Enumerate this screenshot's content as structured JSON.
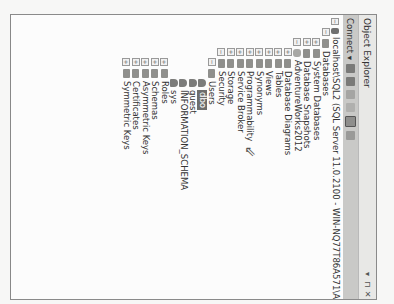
{
  "panel": {
    "title": "Object Explorer",
    "controls": {
      "pin": "▾",
      "autohide": "⊓",
      "close": "✕"
    }
  },
  "toolbar": {
    "connect_label": "Connect ▾"
  },
  "tree": [
    {
      "level": 0,
      "expander": "−",
      "icon": "server",
      "label": "localhost\\SQL2 (SQL Server 11.0.2100 - WIN-NQ77T86A571\\A"
    },
    {
      "level": 1,
      "expander": "−",
      "icon": "folder",
      "label": "Databases"
    },
    {
      "level": 2,
      "expander": "+",
      "icon": "folder",
      "label": "System Databases"
    },
    {
      "level": 2,
      "expander": "+",
      "icon": "folder",
      "label": "Database Snapshots"
    },
    {
      "level": 2,
      "expander": "−",
      "icon": "db",
      "label": "AdventureWorks2012"
    },
    {
      "level": 3,
      "expander": "+",
      "icon": "folder",
      "label": "Database Diagrams"
    },
    {
      "level": 3,
      "expander": "+",
      "icon": "folder",
      "label": "Tables"
    },
    {
      "level": 3,
      "expander": "+",
      "icon": "folder",
      "label": "Views"
    },
    {
      "level": 3,
      "expander": "+",
      "icon": "folder",
      "label": "Synonyms"
    },
    {
      "level": 3,
      "expander": "+",
      "icon": "folder",
      "label": "Programmability"
    },
    {
      "level": 3,
      "expander": "+",
      "icon": "folder",
      "label": "Service Broker"
    },
    {
      "level": 3,
      "expander": "+",
      "icon": "folder",
      "label": "Storage"
    },
    {
      "level": 3,
      "expander": "−",
      "icon": "folder",
      "label": "Security"
    },
    {
      "level": 4,
      "expander": "−",
      "icon": "folder",
      "label": "Users"
    },
    {
      "level": 5,
      "expander": "",
      "icon": "user",
      "label": "dbo",
      "selected": true
    },
    {
      "level": 5,
      "expander": "",
      "icon": "user",
      "label": "guest"
    },
    {
      "level": 5,
      "expander": "",
      "icon": "user",
      "label": "INFORMATION_SCHEMA"
    },
    {
      "level": 5,
      "expander": "",
      "icon": "user",
      "label": "sys"
    },
    {
      "level": 4,
      "expander": "+",
      "icon": "folder",
      "label": "Roles"
    },
    {
      "level": 4,
      "expander": "+",
      "icon": "folder",
      "label": "Schemas"
    },
    {
      "level": 4,
      "expander": "+",
      "icon": "folder",
      "label": "Asymmetric Keys"
    },
    {
      "level": 4,
      "expander": "+",
      "icon": "folder",
      "label": "Certificates"
    },
    {
      "level": 4,
      "expander": "+",
      "icon": "folder",
      "label": "Symmetric Keys"
    }
  ],
  "cursor": "⇖"
}
